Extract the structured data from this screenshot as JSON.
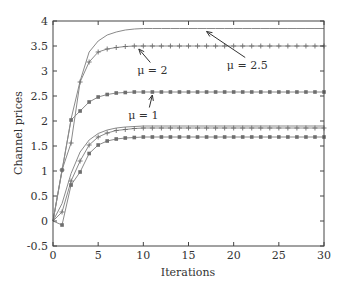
{
  "chart_data": {
    "type": "line",
    "title": "",
    "xlabel": "Iterations",
    "ylabel": "Channel prices",
    "xlim": [
      0,
      30
    ],
    "ylim": [
      -0.5,
      4
    ],
    "xticks": [
      0,
      5,
      10,
      15,
      20,
      25,
      30
    ],
    "yticks": [
      -0.5,
      0,
      0.5,
      1,
      1.5,
      2,
      2.5,
      3,
      3.5,
      4
    ],
    "ytick_labels": [
      "-0.5",
      "0",
      "0.5",
      "1",
      "1.5",
      "2",
      "2.5",
      "3",
      "3.5",
      "4"
    ],
    "grid": false,
    "legend": "none",
    "x": [
      0,
      1,
      2,
      3,
      4,
      5,
      6,
      7,
      8,
      9,
      10,
      11,
      12,
      13,
      14,
      15,
      16,
      17,
      18,
      19,
      20,
      21,
      22,
      23,
      24,
      25,
      26,
      27,
      28,
      29,
      30
    ],
    "series": [
      {
        "name": "mu=2.5 channel A",
        "marker": "none",
        "values": [
          0,
          1.0,
          2.04,
          2.8,
          3.38,
          3.6,
          3.72,
          3.78,
          3.82,
          3.84,
          3.85,
          3.85,
          3.85,
          3.85,
          3.85,
          3.85,
          3.85,
          3.85,
          3.85,
          3.85,
          3.85,
          3.85,
          3.85,
          3.85,
          3.85,
          3.85,
          3.85,
          3.85,
          3.85,
          3.85,
          3.85
        ]
      },
      {
        "name": "mu=2 channel A",
        "marker": "plus",
        "values": [
          0,
          1.02,
          1.56,
          2.78,
          3.18,
          3.38,
          3.44,
          3.47,
          3.49,
          3.5,
          3.5,
          3.5,
          3.5,
          3.5,
          3.5,
          3.5,
          3.5,
          3.5,
          3.5,
          3.5,
          3.5,
          3.5,
          3.5,
          3.5,
          3.5,
          3.5,
          3.5,
          3.5,
          3.5,
          3.5,
          3.5
        ]
      },
      {
        "name": "mu=1 channel A",
        "marker": "square",
        "values": [
          0,
          1.02,
          2.02,
          2.2,
          2.38,
          2.48,
          2.53,
          2.56,
          2.57,
          2.58,
          2.58,
          2.58,
          2.58,
          2.58,
          2.58,
          2.58,
          2.58,
          2.58,
          2.58,
          2.58,
          2.58,
          2.58,
          2.58,
          2.58,
          2.58,
          2.58,
          2.58,
          2.58,
          2.58,
          2.58,
          2.58
        ]
      },
      {
        "name": "mu=2.5 channel B",
        "marker": "none",
        "values": [
          0,
          0.35,
          0.95,
          1.38,
          1.62,
          1.75,
          1.82,
          1.86,
          1.88,
          1.89,
          1.9,
          1.9,
          1.9,
          1.9,
          1.9,
          1.9,
          1.9,
          1.9,
          1.9,
          1.9,
          1.9,
          1.9,
          1.9,
          1.9,
          1.9,
          1.9,
          1.9,
          1.9,
          1.9,
          1.9,
          1.9
        ]
      },
      {
        "name": "mu=2 channel B",
        "marker": "plus",
        "values": [
          0,
          0.18,
          0.8,
          1.2,
          1.52,
          1.68,
          1.76,
          1.81,
          1.83,
          1.85,
          1.86,
          1.86,
          1.86,
          1.86,
          1.86,
          1.86,
          1.86,
          1.86,
          1.86,
          1.86,
          1.86,
          1.86,
          1.86,
          1.86,
          1.86,
          1.86,
          1.86,
          1.86,
          1.86,
          1.86,
          1.86
        ]
      },
      {
        "name": "mu=1 channel B",
        "marker": "square",
        "values": [
          0,
          -0.08,
          0.72,
          0.98,
          1.35,
          1.52,
          1.6,
          1.64,
          1.66,
          1.67,
          1.68,
          1.68,
          1.68,
          1.68,
          1.68,
          1.68,
          1.68,
          1.68,
          1.68,
          1.68,
          1.68,
          1.68,
          1.68,
          1.68,
          1.68,
          1.68,
          1.68,
          1.68,
          1.68,
          1.68,
          1.68
        ]
      }
    ],
    "annotations": [
      {
        "text": "μ = 2.5",
        "x": 21.5,
        "y": 3.05,
        "arrow_to": [
          17,
          3.85
        ]
      },
      {
        "text": "μ = 2",
        "x": 11,
        "y": 2.95,
        "arrow_to": [
          9.5,
          3.5
        ]
      },
      {
        "text": "μ = 1",
        "x": 10,
        "y": 2.05,
        "arrow_to": [
          11,
          2.58
        ]
      }
    ],
    "colors": {
      "axis": "#444444",
      "line": "#8a8a8a",
      "marker": "#6e6e6e"
    }
  }
}
